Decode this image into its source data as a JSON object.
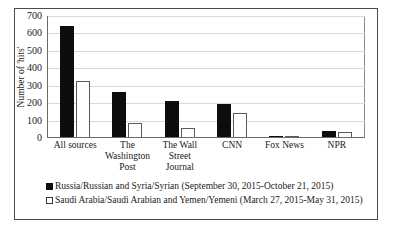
{
  "chart_data": {
    "type": "bar",
    "title": "",
    "xlabel": "",
    "ylabel": "Number of 'hits'",
    "ylim": [
      0,
      700
    ],
    "ytick_values": [
      0,
      100,
      200,
      300,
      400,
      500,
      600,
      700
    ],
    "ytick_labels": [
      "0",
      "100",
      "200",
      "300",
      "400",
      "500",
      "600",
      "700"
    ],
    "grid": true,
    "legend_position": "below",
    "categories": [
      "All sources",
      "The Washington Post",
      "The Wall Street Journal",
      "CNN",
      "Fox News",
      "NPR"
    ],
    "category_lines": [
      [
        "All sources"
      ],
      [
        "The",
        "Washington",
        "Post"
      ],
      [
        "The Wall",
        "Street Journal"
      ],
      [
        "CNN"
      ],
      [
        "Fox News"
      ],
      [
        "NPR"
      ]
    ],
    "series": [
      {
        "name": "Russia/Russian and Syria/Syrian (September 30, 2015-October 21, 2015)",
        "color": "#0d0d0d",
        "fill": "solid-black",
        "values": [
          645,
          265,
          215,
          195,
          5,
          40
        ]
      },
      {
        "name": "Saudi Arabia/Saudi Arabian and Yemen/Yemeni (March 27, 2015-May 31, 2015)",
        "color": "#ffffff",
        "fill": "white-dotted",
        "values": [
          330,
          85,
          55,
          145,
          5,
          35
        ]
      }
    ]
  },
  "legend": {
    "items": [
      {
        "label": "Russia/Russian and Syria/Syrian (September 30, 2015-October 21, 2015)",
        "swatch": "filled-black-square"
      },
      {
        "label": "Saudi Arabia/Saudi Arabian and Yemen/Yemeni (March 27, 2015-May 31, 2015)",
        "swatch": "open-white-square"
      }
    ]
  }
}
